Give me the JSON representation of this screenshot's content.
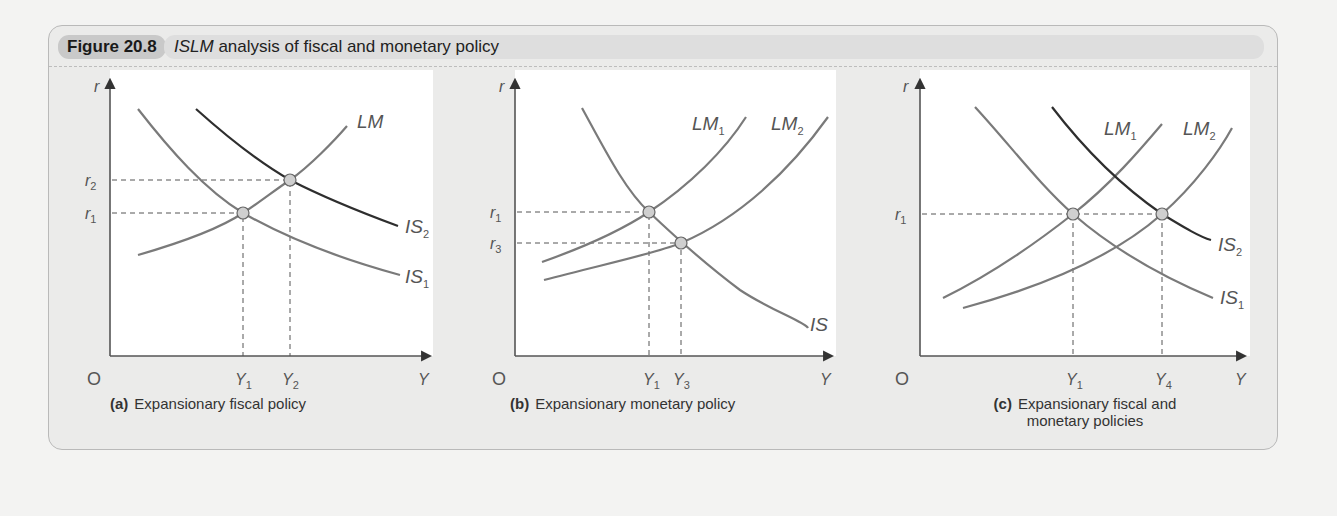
{
  "figure": {
    "label": "Figure 20.8",
    "title_italic": "ISLM",
    "title_rest": " analysis of fiscal and monetary policy"
  },
  "panels": [
    {
      "id": "a",
      "caption_letter": "(a)",
      "caption_text": "Expansionary fiscal policy",
      "axis": {
        "y": "r",
        "x": "Y",
        "origin": "O"
      },
      "y_ticks": [
        "r2",
        "r1"
      ],
      "x_ticks": [
        "Y1",
        "Y2"
      ],
      "curves": [
        "LM",
        "IS1",
        "IS2"
      ]
    },
    {
      "id": "b",
      "caption_letter": "(b)",
      "caption_text": "Expansionary monetary policy",
      "axis": {
        "y": "r",
        "x": "Y",
        "origin": "O"
      },
      "y_ticks": [
        "r1",
        "r3"
      ],
      "x_ticks": [
        "Y1",
        "Y3"
      ],
      "curves": [
        "LM1",
        "LM2",
        "IS"
      ]
    },
    {
      "id": "c",
      "caption_letter": "(c)",
      "caption_text": "Expansionary fiscal and",
      "caption_text2": "monetary policies",
      "axis": {
        "y": "r",
        "x": "Y",
        "origin": "O"
      },
      "y_ticks": [
        "r1"
      ],
      "x_ticks": [
        "Y1",
        "Y4"
      ],
      "curves": [
        "LM1",
        "LM2",
        "IS1",
        "IS2"
      ]
    }
  ],
  "colors": {
    "curve": "#7a7a7a",
    "curve_dark": "#2e2e2e",
    "axis": "#555555",
    "point_fill": "#cfcfcf"
  }
}
